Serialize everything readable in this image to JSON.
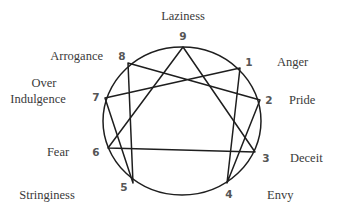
{
  "diagram": {
    "type": "enneagram",
    "colors": {
      "stroke": "#1e1e1e",
      "text": "#3a3a3a",
      "number": "#555555",
      "background": "#ffffff"
    },
    "circle": {
      "cx": 182,
      "cy": 121,
      "rx": 79,
      "ry": 74
    },
    "points": [
      {
        "id": "9",
        "number": "9",
        "label": "Laziness",
        "x": 183,
        "y": 47
      },
      {
        "id": "1",
        "number": "1",
        "label": "Anger",
        "x": 240,
        "y": 68
      },
      {
        "id": "2",
        "number": "2",
        "label": "Pride",
        "x": 260,
        "y": 100
      },
      {
        "id": "3",
        "number": "3",
        "label": "Deceit",
        "x": 255,
        "y": 152
      },
      {
        "id": "4",
        "number": "4",
        "label": "Envy",
        "x": 227,
        "y": 183
      },
      {
        "id": "5",
        "number": "5",
        "label": "Stringiness",
        "x": 133,
        "y": 183
      },
      {
        "id": "6",
        "number": "6",
        "label": "Fear",
        "x": 108,
        "y": 148
      },
      {
        "id": "7",
        "number": "7",
        "label": "Over Indulgence",
        "label_lines": [
          "Over",
          "Indulgence"
        ],
        "x": 105,
        "y": 98
      },
      {
        "id": "8",
        "number": "8",
        "label": "Arrogance",
        "x": 128,
        "y": 63
      }
    ],
    "triangle": [
      "9",
      "3",
      "6"
    ],
    "hexad": [
      "1",
      "4",
      "2",
      "8",
      "5",
      "7"
    ]
  }
}
